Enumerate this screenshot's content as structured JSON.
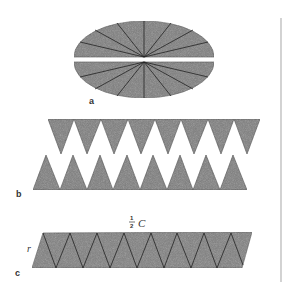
{
  "figure": {
    "colors": {
      "fill": "#7d7d7d",
      "stroke": "#222222",
      "background": "#ffffff",
      "rule": "#b5b5b5"
    },
    "panel_a": {
      "label": "a",
      "description": "Circle cut into sectors, split into two halves",
      "sectors_per_half": 8
    },
    "panel_b": {
      "label": "b",
      "description": "Two halves unrolled into rows of triangular sectors",
      "top_row_count": 8,
      "bottom_row_count": 8
    },
    "panel_c": {
      "label": "c",
      "description": "Sectors interleaved into approximate parallelogram",
      "top_label_num": "1",
      "top_label_den": "2",
      "top_label_var": "C",
      "side_label": "r"
    }
  }
}
